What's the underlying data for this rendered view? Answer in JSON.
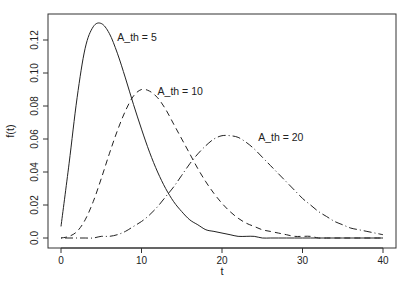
{
  "chart_data": {
    "type": "line",
    "title": "",
    "xlabel": "t",
    "ylabel": "f(t)",
    "xlim": [
      0,
      40
    ],
    "ylim": [
      0,
      0.13
    ],
    "grid": false,
    "legend": "none (inline annotations)",
    "x_ticks": [
      "0",
      "10",
      "20",
      "30",
      "40"
    ],
    "y_ticks": [
      "0.0",
      "0.02",
      "0.04",
      "0.06",
      "0.08",
      "0.10",
      "0.12"
    ],
    "x": [
      0,
      1,
      2,
      3,
      4,
      5,
      6,
      7,
      8,
      9,
      10,
      11,
      12,
      13,
      14,
      15,
      16,
      17,
      18,
      19,
      20,
      21,
      22,
      23,
      24,
      25,
      26,
      27,
      28,
      29,
      30,
      31,
      32,
      33,
      34,
      35,
      36,
      37,
      38,
      39,
      40
    ],
    "series": [
      {
        "name": "A_th = 5",
        "style": "solid",
        "values": [
          0.007,
          0.045,
          0.085,
          0.115,
          0.128,
          0.13,
          0.124,
          0.112,
          0.097,
          0.081,
          0.066,
          0.052,
          0.04,
          0.03,
          0.022,
          0.016,
          0.011,
          0.008,
          0.005,
          0.004,
          0.003,
          0.002,
          0.001,
          0.001,
          0.001,
          0.0,
          0.0,
          0.0,
          0.0,
          0.0,
          0.0,
          0.0,
          0.0,
          0.0,
          0.0,
          0.0,
          0.0,
          0.0,
          0.0,
          0.0,
          0.0
        ]
      },
      {
        "name": "A_th = 10",
        "style": "dashed",
        "values": [
          0.0,
          0.001,
          0.004,
          0.011,
          0.022,
          0.036,
          0.051,
          0.065,
          0.077,
          0.086,
          0.09,
          0.089,
          0.085,
          0.078,
          0.069,
          0.06,
          0.051,
          0.042,
          0.034,
          0.027,
          0.021,
          0.016,
          0.012,
          0.009,
          0.007,
          0.005,
          0.004,
          0.003,
          0.002,
          0.001,
          0.001,
          0.001,
          0.0,
          0.0,
          0.0,
          0.0,
          0.0,
          0.0,
          0.0,
          0.0,
          0.0
        ]
      },
      {
        "name": "A_th = 20",
        "style": "dot-dash",
        "values": [
          0.0,
          0.0,
          0.0,
          0.0,
          0.0,
          0.001,
          0.001,
          0.002,
          0.004,
          0.007,
          0.01,
          0.014,
          0.019,
          0.025,
          0.031,
          0.038,
          0.045,
          0.051,
          0.056,
          0.06,
          0.062,
          0.062,
          0.061,
          0.058,
          0.054,
          0.049,
          0.044,
          0.039,
          0.034,
          0.029,
          0.024,
          0.02,
          0.016,
          0.013,
          0.01,
          0.008,
          0.006,
          0.005,
          0.004,
          0.003,
          0.002
        ]
      }
    ],
    "annotations": [
      {
        "text": "A_th = 5",
        "x": 7,
        "y": 0.122
      },
      {
        "text": "A_th = 10",
        "x": 12,
        "y": 0.089
      },
      {
        "text": "A_th = 20",
        "x": 24.5,
        "y": 0.061
      }
    ]
  }
}
